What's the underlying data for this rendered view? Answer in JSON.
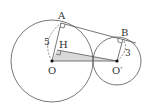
{
  "diagram": {
    "type": "geometry",
    "points": {
      "A": {
        "label": "A",
        "x": 61,
        "y": 23
      },
      "B": {
        "label": "B",
        "x": 123,
        "y": 39
      },
      "O": {
        "label": "O",
        "x": 52,
        "y": 61
      },
      "O_prime": {
        "label": "O′",
        "x": 117,
        "y": 61
      },
      "H": {
        "label": "H",
        "x": 57,
        "y": 50
      }
    },
    "circles": [
      {
        "name": "circle-O",
        "cx": 52,
        "cy": 61,
        "r": 41
      },
      {
        "name": "circle-O-prime",
        "cx": 117,
        "cy": 61,
        "r": 24
      }
    ],
    "lengths": {
      "OA": "5",
      "O_prime_B": "3"
    },
    "colors": {
      "stroke": "#555555",
      "shaded_triangle": "#d9d9d9",
      "point": "#111111",
      "background": "#ffffff"
    }
  }
}
